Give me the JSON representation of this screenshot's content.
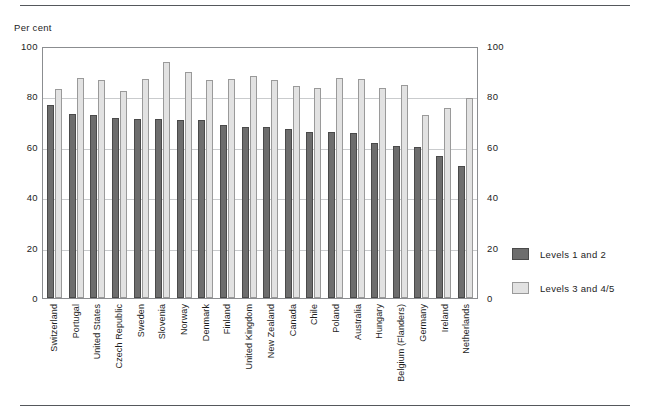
{
  "axis_unit_label": "Per cent",
  "legend": {
    "items": [
      {
        "label": "Levels 1 and 2",
        "color": "#6d6d6d",
        "swatch": "dark-swatch"
      },
      {
        "label": "Levels 3 and 4/5",
        "color": "#e2e2e2",
        "swatch": "light-swatch"
      }
    ]
  },
  "chart_data": {
    "type": "bar",
    "title": "",
    "subtitle": "",
    "xlabel": "",
    "ylabel": "Per cent",
    "ylim": [
      0,
      100
    ],
    "yticks": [
      0,
      20,
      40,
      60,
      80,
      100
    ],
    "ytick_labels": [
      "0",
      "20",
      "40",
      "60",
      "80",
      "100"
    ],
    "grid": true,
    "grid_axis": "y",
    "legend_position": "right",
    "dual_y_axis": true,
    "categories": [
      "Switzerland",
      "Portugal",
      "United States",
      "Czech Republic",
      "Sweden",
      "Slovenia",
      "Norway",
      "Denmark",
      "Finland",
      "United Kingdom",
      "New Zealand",
      "Canada",
      "Chile",
      "Poland",
      "Australia",
      "Hungary",
      "Belgium (Flanders)",
      "Germany",
      "Ireland",
      "Netherlands"
    ],
    "series": [
      {
        "name": "Levels 1 and 2",
        "color": "#6d6d6d",
        "values": [
          76.5,
          73.0,
          72.5,
          71.5,
          71.0,
          71.0,
          70.5,
          70.5,
          68.5,
          68.0,
          68.0,
          67.0,
          66.0,
          66.0,
          65.5,
          61.5,
          60.5,
          60.0,
          56.5,
          52.5
        ]
      },
      {
        "name": "Levels 3 and 4/5",
        "color": "#e2e2e2",
        "values": [
          83.0,
          87.5,
          86.5,
          82.0,
          87.0,
          93.5,
          89.5,
          86.5,
          87.0,
          88.0,
          86.5,
          84.0,
          83.5,
          87.5,
          87.0,
          83.5,
          84.5,
          72.5,
          75.5,
          79.5
        ]
      }
    ]
  }
}
